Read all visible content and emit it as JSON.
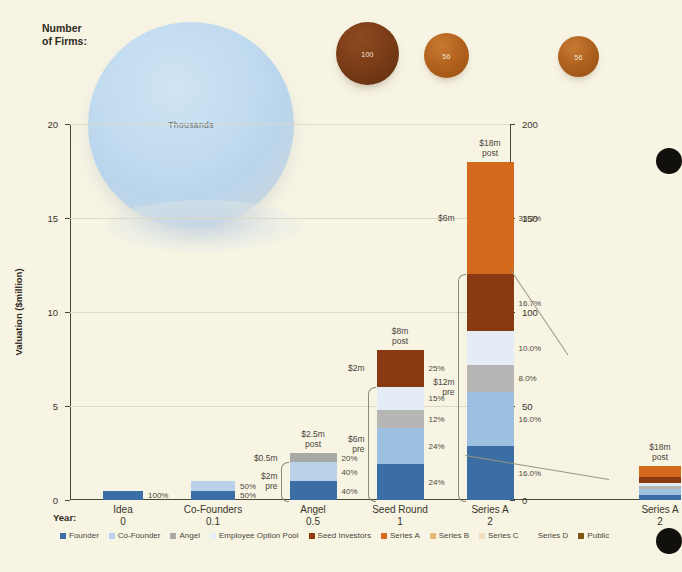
{
  "header": {
    "firms_label_line1": "Number",
    "firms_label_line2": "of Firms:",
    "blob_label": "Thousands",
    "bubbles": [
      {
        "name": "seed-round-firms",
        "count": "100"
      },
      {
        "name": "series-a-firms",
        "count": "56"
      },
      {
        "name": "series-a-right-firms",
        "count": "56"
      }
    ]
  },
  "axes": {
    "y_left_title": "Valuation ($million)",
    "y_left_ticks": [
      "0",
      "5",
      "10",
      "15",
      "20"
    ],
    "y_right_ticks": [
      "0",
      "50",
      "100",
      "150",
      "200"
    ],
    "y_left_max": 20,
    "y_right_max": 200,
    "year_key": "Year:"
  },
  "legend": [
    {
      "label": "Founder",
      "color": "#3a6ea5"
    },
    {
      "label": "Co-Founder",
      "color": "#b9d2ea"
    },
    {
      "label": "Angel",
      "color": "#a8a9a6"
    },
    {
      "label": "Employee Option Pool",
      "color": "#e8eef7"
    },
    {
      "label": "Seed Investors",
      "color": "#8a3a12"
    },
    {
      "label": "Series A",
      "color": "#d2691b"
    },
    {
      "label": "Series B",
      "color": "#e8b878"
    },
    {
      "label": "Series C",
      "color": "#f2dcc0"
    },
    {
      "label": "Series D",
      "color": "#f7f1e2"
    },
    {
      "label": "Public",
      "color": "#7a5a10"
    }
  ],
  "chart_data": {
    "type": "bar",
    "title": "",
    "xlabel": "",
    "ylabel": "Valuation ($million)",
    "ylim": [
      0,
      20
    ],
    "ylim_right": [
      0,
      200
    ],
    "grid": true,
    "legend_position": "bottom",
    "categories": [
      "Idea",
      "Co-Founders",
      "Angel",
      "Seed Round",
      "Series A",
      "Series A"
    ],
    "years": [
      "0",
      "0.1",
      "0.5",
      "1",
      "2",
      "2"
    ],
    "series": [
      {
        "name": "Founder",
        "color": "#3a6ea5"
      },
      {
        "name": "Co-Founder",
        "color": "#b9d2ea"
      },
      {
        "name": "Angel",
        "color": "#a8a9a6"
      },
      {
        "name": "Employee Option Pool",
        "color": "#e8eef7"
      },
      {
        "name": "Seed Investors",
        "color": "#8a3a12"
      },
      {
        "name": "Series A",
        "color": "#d2691b"
      }
    ],
    "bars": [
      {
        "category": "Idea",
        "year": "0",
        "axis": "left",
        "total": 0.5,
        "post_label": "",
        "pre_label": "",
        "pre_amount_label": "",
        "segments": [
          {
            "series": "Founder",
            "color": "#3a6ea5",
            "value": 0.5,
            "pct": "100%"
          }
        ]
      },
      {
        "category": "Co-Founders",
        "year": "0.1",
        "axis": "left",
        "total": 1.0,
        "post_label": "",
        "pre_label": "",
        "pre_amount_label": "",
        "segments": [
          {
            "series": "Founder",
            "color": "#3a6ea5",
            "value": 0.5,
            "pct": "50%"
          },
          {
            "series": "Co-Founder",
            "color": "#b9d2ea",
            "value": 0.5,
            "pct": "50%"
          }
        ]
      },
      {
        "category": "Angel",
        "year": "0.5",
        "axis": "left",
        "total": 2.5,
        "post_label": "$2.5m\npost",
        "post_label_1": "$2.5m",
        "post_label_2": "post",
        "new_money_label": "$0.5m",
        "pre_amount_label": "$2m",
        "pre_word": "pre",
        "segments": [
          {
            "series": "Founder",
            "color": "#3a6ea5",
            "value": 1.0,
            "pct": "40%"
          },
          {
            "series": "Co-Founder",
            "color": "#b9d2ea",
            "value": 1.0,
            "pct": "40%"
          },
          {
            "series": "Angel",
            "color": "#a8a9a6",
            "value": 0.5,
            "pct": "20%"
          }
        ]
      },
      {
        "category": "Seed Round",
        "year": "1",
        "axis": "left",
        "total": 8.0,
        "post_label_1": "$8m",
        "post_label_2": "post",
        "new_money_label": "$2m",
        "pre_amount_label": "$6m",
        "pre_word": "pre",
        "segments": [
          {
            "series": "Founder",
            "color": "#3a6ea5",
            "value": 1.92,
            "pct": "24%"
          },
          {
            "series": "Co-Founder",
            "color": "#9dc0e0",
            "value": 1.92,
            "pct": "24%"
          },
          {
            "series": "Angel",
            "color": "#b6b7b4",
            "value": 0.96,
            "pct": "12%"
          },
          {
            "series": "Employee Option Pool",
            "color": "#e4ecf6",
            "value": 1.2,
            "pct": "15%"
          },
          {
            "series": "Seed Investors",
            "color": "#8a3a12",
            "value": 2.0,
            "pct": "25%"
          }
        ]
      },
      {
        "category": "Series A",
        "year": "2",
        "axis": "left",
        "total": 18.0,
        "post_label_1": "$18m",
        "post_label_2": "post",
        "new_money_label": "$6m",
        "pre_amount_label": "$12m",
        "pre_word": "pre",
        "segments": [
          {
            "series": "Founder",
            "color": "#3a6ea5",
            "value": 2.88,
            "pct": "16.0%"
          },
          {
            "series": "Co-Founder",
            "color": "#9dc0e0",
            "value": 2.88,
            "pct": "16.0%"
          },
          {
            "series": "Angel",
            "color": "#b6b7b4",
            "value": 1.44,
            "pct": "8.0%"
          },
          {
            "series": "Employee Option Pool",
            "color": "#e4ecf6",
            "value": 1.8,
            "pct": "10.0%"
          },
          {
            "series": "Seed Investors",
            "color": "#8a3a12",
            "value": 3.0,
            "pct": "16.7%"
          },
          {
            "series": "Series A",
            "color": "#d2691b",
            "value": 6.0,
            "pct": "33.3%"
          }
        ]
      },
      {
        "category": "Series A",
        "year": "2",
        "axis": "right",
        "total": 18.0,
        "post_label_1": "$18m",
        "post_label_2": "post",
        "new_money_label": "",
        "pre_amount_label": "",
        "pre_word": "",
        "segments": [
          {
            "series": "Founder",
            "color": "#3a6ea5",
            "value": 2.88,
            "pct": ""
          },
          {
            "series": "Co-Founder",
            "color": "#9dc0e0",
            "value": 2.88,
            "pct": ""
          },
          {
            "series": "Angel",
            "color": "#b6b7b4",
            "value": 1.44,
            "pct": ""
          },
          {
            "series": "Employee Option Pool",
            "color": "#e4ecf6",
            "value": 1.8,
            "pct": ""
          },
          {
            "series": "Seed Investors",
            "color": "#8a3a12",
            "value": 3.0,
            "pct": ""
          },
          {
            "series": "Series A",
            "color": "#d2691b",
            "value": 6.0,
            "pct": ""
          }
        ]
      }
    ]
  }
}
